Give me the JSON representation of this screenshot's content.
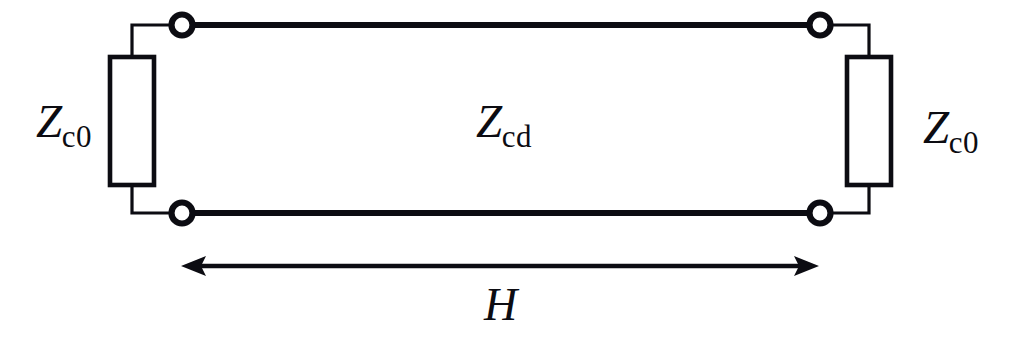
{
  "figure": {
    "type": "circuit-schematic",
    "background_color": "#ffffff",
    "stroke_color": "#0c0c12",
    "width": 1013,
    "height": 338
  },
  "labels": {
    "termination_left": {
      "symbol": "Z",
      "subscript": "c0"
    },
    "termination_right": {
      "symbol": "Z",
      "subscript": "c0"
    },
    "line_impedance": {
      "symbol": "Z",
      "subscript": "cd"
    },
    "length": {
      "symbol": "H",
      "subscript": ""
    }
  },
  "components": {
    "resistor_left": {
      "name": "Zc0-left-resistor",
      "x": 110,
      "y": 57,
      "width": 44,
      "height": 128
    },
    "resistor_right": {
      "name": "Zc0-right-resistor",
      "x": 847,
      "y": 57,
      "width": 44,
      "height": 128
    },
    "terminals": [
      {
        "name": "terminal-top-left",
        "cx": 182,
        "cy": 25,
        "r": 11
      },
      {
        "name": "terminal-top-right",
        "cx": 820,
        "cy": 25,
        "r": 11
      },
      {
        "name": "terminal-bottom-left",
        "cx": 182,
        "cy": 213,
        "r": 11
      },
      {
        "name": "terminal-bottom-right",
        "cx": 820,
        "cy": 213,
        "r": 11
      }
    ],
    "transmission_lines": [
      {
        "name": "conductor-top",
        "x1": 193,
        "y1": 25,
        "x2": 809,
        "y2": 25
      },
      {
        "name": "conductor-bottom",
        "x1": 193,
        "y1": 213,
        "x2": 809,
        "y2": 213
      }
    ],
    "dimension": {
      "name": "length-dimension-arrow",
      "x1": 182,
      "x2": 818,
      "y": 266
    }
  }
}
